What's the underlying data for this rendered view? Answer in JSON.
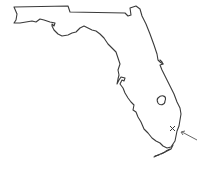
{
  "map": {
    "subject": "Florida state outline",
    "marker": {
      "type": "x-mark",
      "location": "southeast coast near Miami"
    },
    "pointer": {
      "type": "arrow",
      "direction": "pointing to marker from lower right"
    },
    "colors": {
      "line": "#3a3a3a",
      "background": "#ffffff"
    }
  }
}
